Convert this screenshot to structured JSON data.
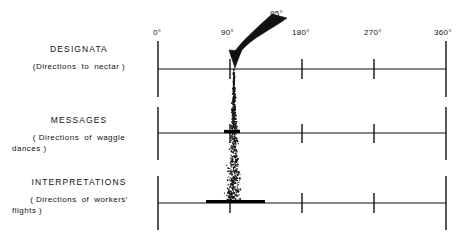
{
  "figure": {
    "background_color": "#ffffff",
    "ink_color": "#111111"
  },
  "rows": [
    {
      "id": "designata",
      "title": "DESIGNATA",
      "subtitle_words": [
        "(Directions",
        "to",
        "nectar )"
      ],
      "baseline_y": 69
    },
    {
      "id": "messages",
      "title": "MESSAGES",
      "subtitle_words": [
        "( Directions",
        "of",
        "waggle"
      ],
      "subtitle_line2": "dances )",
      "baseline_y": 133
    },
    {
      "id": "interpretations",
      "title": "INTERPRETATIONS",
      "subtitle_words": [
        "( Directions",
        "of",
        "workers'"
      ],
      "subtitle_line2": "flights )",
      "baseline_y": 203
    }
  ],
  "axis": {
    "x_start_px": 158,
    "x_end_px": 446,
    "ticks": [
      {
        "label": "0°",
        "degrees": 0,
        "x": 158
      },
      {
        "label": "90°",
        "degrees": 90,
        "x": 230
      },
      {
        "label": "180°",
        "degrees": 180,
        "x": 302
      },
      {
        "label": "270°",
        "degrees": 270,
        "x": 374
      },
      {
        "label": "360°",
        "degrees": 360,
        "x": 446
      }
    ]
  },
  "annotation": {
    "arrow_label": "95°",
    "arrow_points_to_degrees": 90,
    "arrow_tip_x": 236,
    "arrow_tip_y": 66
  },
  "chart_data": {
    "type": "scatter",
    "xlabel": "",
    "ylabel": "",
    "xlim": [
      0,
      360
    ],
    "grid": false,
    "legend": "none",
    "series": [
      {
        "name": "DESIGNATA",
        "center_degrees": 95,
        "spread_degrees": 0,
        "dot_count": 0,
        "bar_half_width_degrees": 0,
        "note": "single exact direction indicated by arrow"
      },
      {
        "name": "MESSAGES",
        "center_degrees": 95,
        "spread_degrees": 11,
        "dot_count": 340,
        "bar_half_width_degrees": 5.5,
        "note": "narrow dense cone, moderate scatter"
      },
      {
        "name": "INTERPRETATIONS",
        "center_degrees": 95,
        "spread_degrees": 30,
        "dot_count": 430,
        "bar_half_width_degrees": 15,
        "note": "wide sparse cone, greatest scatter"
      }
    ]
  }
}
